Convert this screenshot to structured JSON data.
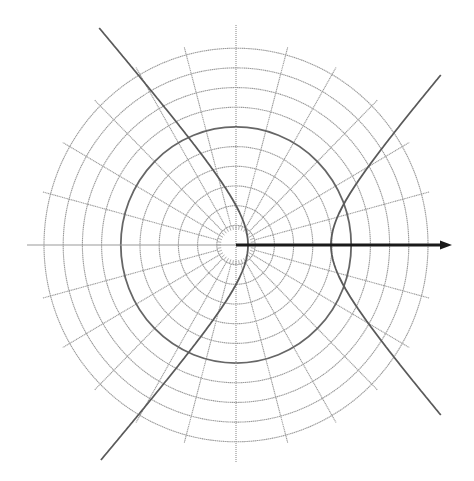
{
  "diagram": {
    "type": "polar-grid-with-hyperbola",
    "canvas": {
      "width": 474,
      "height": 481,
      "background": "#ffffff"
    },
    "origin": {
      "x": 236,
      "y": 245
    },
    "grid": {
      "circle_count": 10,
      "circle_spacing": 19.2,
      "y_scale": 1.025,
      "highlighted_circle_index": 6,
      "spoke_step_deg": 15,
      "spoke_overhang": 8,
      "inner_tick_radius": 19,
      "inner_tick_count": 36,
      "grid_color": "#9a9a9a",
      "highlight_color": "#666666"
    },
    "axes": {
      "horizontal": {
        "x1": 27,
        "x2": 236,
        "color": "#9a9a9a",
        "style": "solid"
      },
      "vertical": {
        "y1": 25,
        "y2": 463,
        "color": "#9a9a9a",
        "style": "dotted"
      }
    },
    "vector": {
      "x1": 236,
      "x2": 452,
      "color": "#1a1a1a",
      "label": ""
    },
    "hyperbola": {
      "center_x": 289.5,
      "a": 41.5,
      "b": 48.5,
      "y_top": 28,
      "y_bottom": 460,
      "right_y_top": 75,
      "right_y_bottom": 415,
      "color": "#5a5a5a"
    }
  }
}
